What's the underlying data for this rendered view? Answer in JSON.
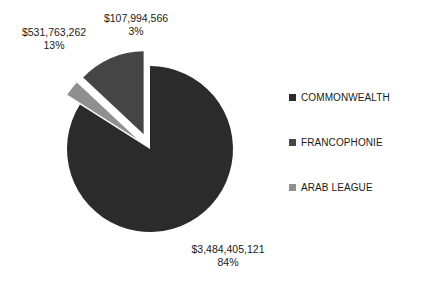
{
  "chart_data": {
    "type": "pie",
    "title": "",
    "exploded": true,
    "legend_position": "right",
    "grid": false,
    "categories": [
      "COMMONWEALTH",
      "FRANCOPHONIE",
      "ARAB LEAGUE"
    ],
    "values": [
      3484405121,
      531763262,
      107994566
    ],
    "value_labels": [
      "$3,484,405,121",
      "$531,763,262",
      "$107,994,566"
    ],
    "percent_labels": [
      "84%",
      "13%",
      "3%"
    ],
    "percents": [
      84,
      13,
      3
    ],
    "colors": [
      "#2b2b2b",
      "#454545",
      "#8f8f8f"
    ],
    "slices": [
      {
        "name": "COMMONWEALTH",
        "value": 3484405121,
        "value_label": "$3,484,405,121",
        "percent": 84,
        "percent_label": "84%",
        "color": "#2b2b2b",
        "exploded": false
      },
      {
        "name": "FRANCOPHONIE",
        "value": 531763262,
        "value_label": "$531,763,262",
        "percent": 13,
        "percent_label": "13%",
        "color": "#454545",
        "exploded": true
      },
      {
        "name": "ARAB LEAGUE",
        "value": 107994566,
        "value_label": "$107,994,566",
        "percent": 3,
        "percent_label": "3%",
        "color": "#8f8f8f",
        "exploded": true
      }
    ]
  },
  "legend": {
    "items": [
      {
        "label": "COMMONWEALTH",
        "color": "#2b2b2b"
      },
      {
        "label": "FRANCOPHONIE",
        "color": "#454545"
      },
      {
        "label": "ARAB LEAGUE",
        "color": "#8f8f8f"
      }
    ]
  },
  "labels": {
    "commonwealth": {
      "value": "$3,484,405,121",
      "percent": "84%"
    },
    "francophonie": {
      "value": "$531,763,262",
      "percent": "13%"
    },
    "arableague": {
      "value": "$107,994,566",
      "percent": "3%"
    }
  },
  "background": "#ffffff"
}
